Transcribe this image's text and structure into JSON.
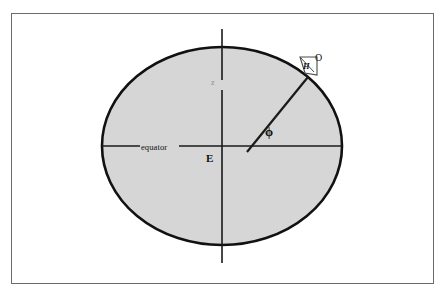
{
  "figure": {
    "type": "geometry-diagram",
    "background_color": "#ffffff",
    "frame_color": "#6b6b6b",
    "ellipse_fill": "#d6d6d6",
    "ellipse_stroke": "#111111",
    "line_color": "#1a1a1a"
  },
  "labels": {
    "equator": "equator",
    "center": "E",
    "axis": "z",
    "point_o": "O",
    "angle_h": "H",
    "angle_phi": "ϕ"
  },
  "geometry": {
    "frame": {
      "x": 11,
      "y": 13,
      "width": 423,
      "height": 271
    },
    "ellipse": {
      "cx": 222,
      "cy": 146,
      "rx": 120,
      "ry": 99
    },
    "equator_line": {
      "x1": 102,
      "y1": 146,
      "x2": 342,
      "y2": 146
    },
    "axis_line": {
      "x1": 222,
      "y1": 29,
      "x2": 222,
      "y2": 263
    },
    "radius_line": {
      "x1": 247,
      "y1": 152,
      "x2": 308,
      "y2": 77
    },
    "angle_marker": {
      "x": 300,
      "y": 56,
      "size": 18
    }
  }
}
